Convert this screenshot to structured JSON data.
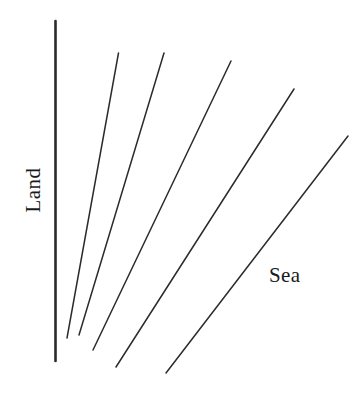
{
  "figure": {
    "background_color": "#ffffff",
    "line_color": "#2b2b2b",
    "width": 363,
    "height": 405
  },
  "labels": {
    "land": "Land",
    "sea": "Sea"
  },
  "chart_data": {
    "type": "line",
    "title": "",
    "xlabel": "",
    "ylabel": "",
    "grid": false,
    "legend": "none",
    "annotations": [
      {
        "text": "Land",
        "x": 33,
        "y": 190,
        "rotation": -90
      },
      {
        "text": "Sea",
        "x": 290,
        "y": 277,
        "rotation": 0
      }
    ],
    "series": [
      {
        "name": "coastline-baseline",
        "role": "land-boundary",
        "style": "thick-vertical",
        "stroke_width": 2.6,
        "x": [
          55.5,
          55.5
        ],
        "y": [
          21,
          361
        ]
      },
      {
        "name": "ray-1",
        "role": "radiating-line",
        "style": "thin",
        "stroke_width": 1.5,
        "x": [
          118.5,
          67
        ],
        "y": [
          53,
          338
        ]
      },
      {
        "name": "ray-2",
        "role": "radiating-line",
        "style": "thin",
        "stroke_width": 1.5,
        "x": [
          164,
          79
        ],
        "y": [
          53,
          335
        ]
      },
      {
        "name": "ray-3",
        "role": "radiating-line",
        "style": "thin",
        "stroke_width": 1.5,
        "x": [
          231,
          93
        ],
        "y": [
          61,
          350
        ]
      },
      {
        "name": "ray-4",
        "role": "radiating-line",
        "style": "thin",
        "stroke_width": 1.5,
        "x": [
          294,
          116
        ],
        "y": [
          89,
          367
        ]
      },
      {
        "name": "ray-5",
        "role": "radiating-line",
        "style": "thin",
        "stroke_width": 1.5,
        "x": [
          348,
          166
        ],
        "y": [
          136,
          373
        ]
      }
    ]
  }
}
